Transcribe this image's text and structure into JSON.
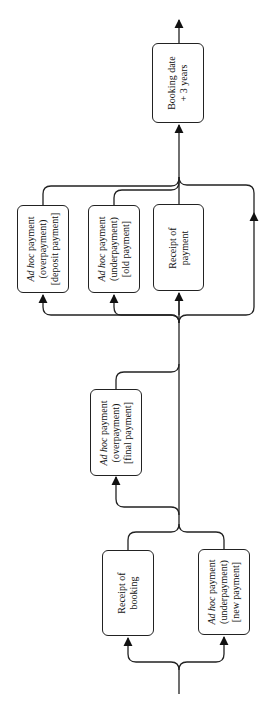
{
  "diagram": {
    "orientation": "rotated-90-ccw",
    "nodes": [
      {
        "id": "receipt_booking",
        "lines": [
          "Receipt of",
          "booking"
        ]
      },
      {
        "id": "new_payment",
        "italic": "Ad hoc",
        "lines": [
          " payment",
          "(underpayment)",
          "[new  payment]"
        ]
      },
      {
        "id": "final_payment",
        "italic": "Ad hoc",
        "lines": [
          " payment",
          "(overpayment)",
          "[final  payment]"
        ]
      },
      {
        "id": "deposit_payment",
        "italic": "Ad hoc",
        "lines": [
          " payment",
          "(overpayment)",
          "[deposit  payment]"
        ]
      },
      {
        "id": "old_payment",
        "italic": "Ad hoc",
        "lines": [
          " payment",
          "(underpayment)",
          "[old  payment]"
        ]
      },
      {
        "id": "receipt_payment",
        "lines": [
          "Receipt of",
          "payment"
        ]
      },
      {
        "id": "booking_date",
        "lines": [
          "Booking  date",
          "+ 3  years"
        ]
      }
    ],
    "edges": [
      {
        "from": "start",
        "to": "receipt_booking"
      },
      {
        "from": "start",
        "to": "new_payment"
      },
      {
        "from": "receipt_booking",
        "to": "merge1"
      },
      {
        "from": "new_payment",
        "to": "merge1"
      },
      {
        "from": "merge1",
        "to": "final_payment"
      },
      {
        "from": "final_payment",
        "to": "merge2"
      },
      {
        "from": "merge1",
        "to": "merge2"
      },
      {
        "from": "merge2",
        "to": "deposit_payment"
      },
      {
        "from": "merge2",
        "to": "old_payment"
      },
      {
        "from": "merge2",
        "to": "receipt_payment"
      },
      {
        "from": "merge2",
        "to": "bypass"
      },
      {
        "from": "deposit_payment",
        "to": "merge3"
      },
      {
        "from": "old_payment",
        "to": "merge3"
      },
      {
        "from": "receipt_payment",
        "to": "merge3"
      },
      {
        "from": "bypass",
        "to": "merge3"
      },
      {
        "from": "merge3",
        "to": "booking_date"
      },
      {
        "from": "booking_date",
        "to": "end"
      }
    ]
  }
}
